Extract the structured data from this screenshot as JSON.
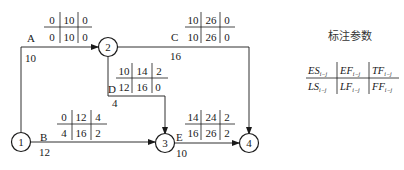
{
  "legend": {
    "title": "标注参数",
    "cells": [
      {
        "main": "ES",
        "sub": "i−j"
      },
      {
        "main": "EF",
        "sub": "i−j"
      },
      {
        "main": "TF",
        "sub": "i−j"
      },
      {
        "main": "LS",
        "sub": "i−j"
      },
      {
        "main": "LF",
        "sub": "i−j"
      },
      {
        "main": "FF",
        "sub": "i−j"
      }
    ]
  },
  "nodes": [
    {
      "id": "1",
      "label": "1"
    },
    {
      "id": "2",
      "label": "2"
    },
    {
      "id": "3",
      "label": "3"
    },
    {
      "id": "4",
      "label": "4"
    }
  ],
  "activities": {
    "A": {
      "name": "A",
      "duration": "10",
      "from": "1",
      "to": "2",
      "ES": "0",
      "EF": "10",
      "TF": "0",
      "LS": "0",
      "LF": "10",
      "FF": "0"
    },
    "B": {
      "name": "B",
      "duration": "12",
      "from": "1",
      "to": "3",
      "ES": "0",
      "EF": "12",
      "TF": "4",
      "LS": "4",
      "LF": "16",
      "FF": "2"
    },
    "C": {
      "name": "C",
      "duration": "16",
      "from": "2",
      "to": "4",
      "ES": "10",
      "EF": "26",
      "TF": "0",
      "LS": "10",
      "LF": "26",
      "FF": "0"
    },
    "D": {
      "name": "D",
      "duration": "4",
      "from": "2",
      "to": "3",
      "ES": "10",
      "EF": "14",
      "TF": "2",
      "LS": "12",
      "LF": "16",
      "FF": "0"
    },
    "E": {
      "name": "E",
      "duration": "10",
      "from": "3",
      "to": "4",
      "ES": "14",
      "EF": "24",
      "TF": "2",
      "LS": "16",
      "LF": "26",
      "FF": "2"
    }
  }
}
